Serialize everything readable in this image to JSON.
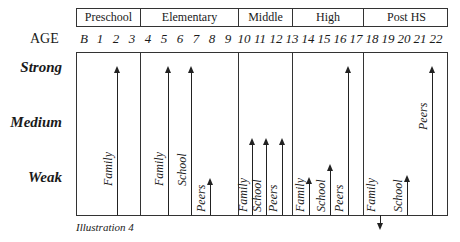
{
  "header": {
    "stages": [
      {
        "label": "Preschool",
        "x0": 76,
        "x1": 140
      },
      {
        "label": "Elementary",
        "x0": 140,
        "x1": 238
      },
      {
        "label": "Middle",
        "x0": 238,
        "x1": 292
      },
      {
        "label": "High",
        "x0": 292,
        "x1": 363
      },
      {
        "label": "Post HS",
        "x0": 363,
        "x1": 448
      }
    ]
  },
  "age_row": {
    "label": "AGE",
    "ticks": [
      "B",
      "1",
      "2",
      "3",
      "4",
      "5",
      "6",
      "7",
      "8",
      "9",
      "10",
      "11",
      "12",
      "13",
      "14",
      "15",
      "16",
      "17",
      "18",
      "19",
      "20",
      "21",
      "22"
    ]
  },
  "levels": [
    "Strong",
    "Medium",
    "Weak"
  ],
  "arrows": [
    {
      "stage": "Preschool",
      "label": "Family",
      "x": 117,
      "top": 66,
      "dir": "up"
    },
    {
      "stage": "Elementary",
      "label": "Family",
      "x": 168,
      "top": 66,
      "dir": "up"
    },
    {
      "stage": "Elementary",
      "label": "School",
      "x": 191,
      "top": 66,
      "dir": "up"
    },
    {
      "stage": "Elementary",
      "label": "Peers",
      "x": 210,
      "top": 178,
      "dir": "up"
    },
    {
      "stage": "Middle",
      "label": "Family",
      "x": 252,
      "top": 138,
      "dir": "up"
    },
    {
      "stage": "Middle",
      "label": "School",
      "x": 266,
      "top": 138,
      "dir": "up"
    },
    {
      "stage": "Middle",
      "label": "Peers",
      "x": 282,
      "top": 138,
      "dir": "up"
    },
    {
      "stage": "High",
      "label": "Family",
      "x": 309,
      "top": 177,
      "dir": "up"
    },
    {
      "stage": "High",
      "label": "School",
      "x": 330,
      "top": 164,
      "dir": "up"
    },
    {
      "stage": "High",
      "label": "Peers",
      "x": 348,
      "top": 66,
      "dir": "up"
    },
    {
      "stage": "Post HS",
      "label": "Family",
      "x": 380,
      "top": 230,
      "dir": "down"
    },
    {
      "stage": "Post HS",
      "label": "School",
      "x": 407,
      "top": 175,
      "dir": "up"
    },
    {
      "stage": "Post HS",
      "label": "Peers",
      "x": 432,
      "top": 66,
      "dir": "up"
    }
  ],
  "caption": "Illustration 4"
}
